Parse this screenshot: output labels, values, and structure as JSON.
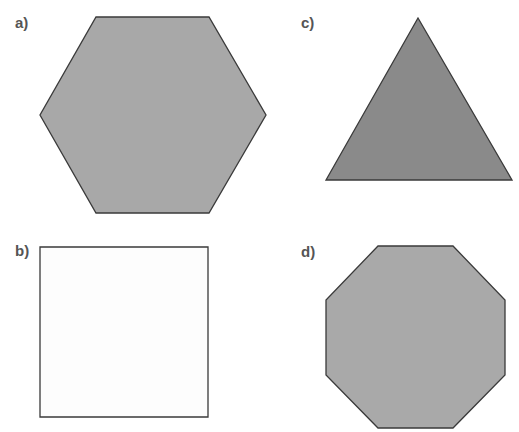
{
  "figure": {
    "panels": [
      {
        "label": "a)",
        "shape": "hexagon",
        "sides": 6,
        "fill": "#a8a8a8",
        "stroke": "#3a3a3a",
        "points": "96,17 209,17 266,115 209,213 96,213 40,115"
      },
      {
        "label": "b)",
        "shape": "square",
        "sides": 4,
        "fill": "#fdfdfd",
        "stroke": "#3a3a3a",
        "points": "40,247 208,247 208,417 40,417"
      },
      {
        "label": "c)",
        "shape": "triangle",
        "sides": 3,
        "fill": "#8a8a8a",
        "stroke": "#3a3a3a",
        "points": "418,18 512,180 326,180"
      },
      {
        "label": "d)",
        "shape": "octagon",
        "sides": 8,
        "fill": "#a9a9a9",
        "stroke": "#3a3a3a",
        "points": "378,246 453,246 505,300 505,375 453,428 378,428 326,375 326,300"
      }
    ]
  }
}
